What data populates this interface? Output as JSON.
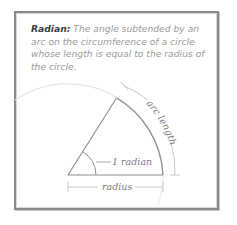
{
  "definition": {
    "term": "Radian:",
    "text": " The angle subtended by an arc on the circumference of a circle whose length is equal to the radius of the circle."
  },
  "diagram": {
    "angle_label": "1 radian",
    "radius_label": "radius",
    "arc_label": "arc length"
  },
  "colors": {
    "frame": "#8a8a8a",
    "sector_line": "#8c8c8c",
    "faint_circle": "#e2e2e2",
    "bracket": "#bdbdbd",
    "term_text": "#3a3a3a",
    "body_text": "#9a9a9a"
  }
}
